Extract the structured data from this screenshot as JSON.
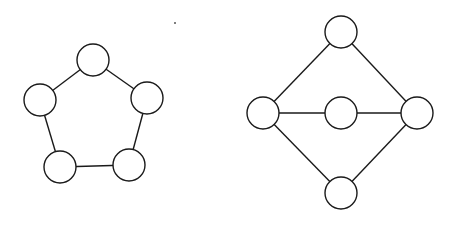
{
  "graphs": [
    {
      "name": "cycle-graph-c5",
      "node_radius": 16,
      "nodes": [
        {
          "id": "a",
          "x": 93,
          "y": 60
        },
        {
          "id": "b",
          "x": 147,
          "y": 98
        },
        {
          "id": "c",
          "x": 129,
          "y": 165
        },
        {
          "id": "d",
          "x": 60,
          "y": 167
        },
        {
          "id": "e",
          "x": 40,
          "y": 100
        }
      ],
      "edges": [
        [
          "a",
          "b"
        ],
        [
          "b",
          "c"
        ],
        [
          "c",
          "d"
        ],
        [
          "d",
          "e"
        ],
        [
          "e",
          "a"
        ]
      ]
    },
    {
      "name": "diamond-graph",
      "node_radius": 16,
      "nodes": [
        {
          "id": "top",
          "x": 341,
          "y": 32
        },
        {
          "id": "left",
          "x": 263,
          "y": 113
        },
        {
          "id": "mid",
          "x": 341,
          "y": 113
        },
        {
          "id": "right",
          "x": 417,
          "y": 113
        },
        {
          "id": "bottom",
          "x": 341,
          "y": 193
        }
      ],
      "edges": [
        [
          "top",
          "left"
        ],
        [
          "top",
          "right"
        ],
        [
          "left",
          "mid"
        ],
        [
          "mid",
          "right"
        ],
        [
          "left",
          "bottom"
        ],
        [
          "right",
          "bottom"
        ]
      ]
    }
  ],
  "artifacts": [
    {
      "x": 175,
      "y": 23,
      "r": 1
    }
  ],
  "colors": {
    "stroke": "#1a1a1a",
    "fill": "#ffffff",
    "background": "#ffffff"
  }
}
